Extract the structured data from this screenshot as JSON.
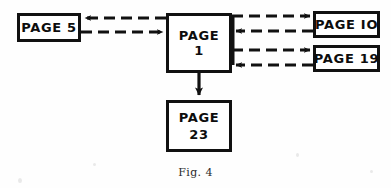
{
  "figure": {
    "caption": "Fig. 4",
    "background_color": "#fefefe",
    "ink_color": "#111111"
  },
  "nodes": [
    {
      "id": "page-5",
      "label": "PAGE 5",
      "line1": "PAGE 5",
      "line2": "",
      "x": 17,
      "y": 13,
      "width": 64,
      "height": 29
    },
    {
      "id": "page-1",
      "label": "PAGE 1",
      "line1": "PAGE",
      "line2": "1",
      "x": 166,
      "y": 13,
      "width": 66,
      "height": 60
    },
    {
      "id": "page-10",
      "label": "PAGE IO",
      "line1": "PAGE IO",
      "line2": "",
      "x": 313,
      "y": 11,
      "width": 67,
      "height": 27
    },
    {
      "id": "page-19",
      "label": "PAGE 19",
      "line1": "PAGE 19",
      "line2": "",
      "x": 313,
      "y": 45,
      "width": 67,
      "height": 27
    },
    {
      "id": "page-23",
      "label": "PAGE 23",
      "line1": "PAGE",
      "line2": "23",
      "x": 166,
      "y": 100,
      "width": 66,
      "height": 52
    }
  ],
  "connectors": [
    {
      "id": "page1-to-page5",
      "from": "page-1",
      "to": "page-5",
      "style": "dashed",
      "direction": "left",
      "x1": 166,
      "y1": 18,
      "x2": 83,
      "y2": 18
    },
    {
      "id": "page5-to-page1",
      "from": "page-5",
      "to": "page-1",
      "style": "dashed",
      "direction": "right",
      "x1": 81,
      "y1": 32,
      "x2": 164,
      "y2": 32
    },
    {
      "id": "page1-to-page10",
      "from": "page-1",
      "to": "page-10",
      "style": "dashed",
      "direction": "right",
      "x1": 232,
      "y1": 16,
      "x2": 311,
      "y2": 16
    },
    {
      "id": "page10-to-page1",
      "from": "page-10",
      "to": "page-1",
      "style": "dashed",
      "direction": "left",
      "x1": 313,
      "y1": 31,
      "x2": 234,
      "y2": 31
    },
    {
      "id": "page1-to-page19",
      "from": "page-1",
      "to": "page-19",
      "style": "dashed",
      "direction": "right",
      "x1": 232,
      "y1": 50,
      "x2": 311,
      "y2": 50
    },
    {
      "id": "page19-to-page1",
      "from": "page-19",
      "to": "page-1",
      "style": "dashed",
      "direction": "left",
      "x1": 313,
      "y1": 65,
      "x2": 234,
      "y2": 65
    },
    {
      "id": "page1-to-page23",
      "from": "page-1",
      "to": "page-23",
      "style": "solid",
      "direction": "down",
      "x1": 199,
      "y1": 73,
      "x2": 199,
      "y2": 98
    }
  ]
}
